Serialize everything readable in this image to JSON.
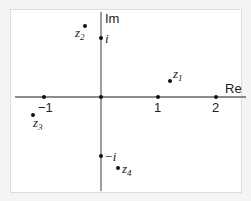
{
  "diagram": {
    "axes": {
      "x_label": "Re",
      "y_label": "Im"
    },
    "x_ticks": [
      "−1",
      "1",
      "2"
    ],
    "y_ticks": [
      "i",
      "−i"
    ],
    "points": [
      {
        "name": "z",
        "sub": "1",
        "re": 1.2,
        "im": 0.55
      },
      {
        "name": "z",
        "sub": "2",
        "re": -0.3,
        "im": 1.25
      },
      {
        "name": "z",
        "sub": "3",
        "re": -1.2,
        "im": -0.3
      },
      {
        "name": "z",
        "sub": "4",
        "re": 0.3,
        "im": -1.2
      }
    ],
    "colors": {
      "axis": "#555555",
      "point": "#111111",
      "background": "#ffffff"
    }
  }
}
